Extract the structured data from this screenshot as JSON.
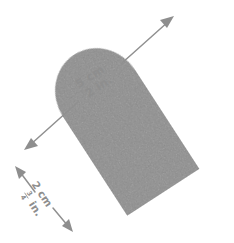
{
  "figure": {
    "background_color": "#ffffff",
    "object": {
      "name": "rounded-capsule-block",
      "fill_color": "#8c8c8c",
      "texture": "grainy-scan",
      "rotation_degrees": -33,
      "shape_description": "rectangle with one rounded (domed) end and one flat end"
    },
    "annotations": {
      "length": {
        "name": "length-dimension",
        "arrow_style": "double-headed",
        "label_metric": "5 cm",
        "label_imperial": "2 in.",
        "text_rotation_degrees": -33,
        "arrow_color": "#8e8e8e"
      },
      "width": {
        "name": "width-dimension",
        "arrow_style": "double-headed-split",
        "label_metric": "2 cm",
        "label_imperial_whole": "",
        "label_imperial_numerator": "3",
        "label_imperial_denominator": "4",
        "label_imperial_unit": "in.",
        "label_imperial_full": "3/4 in.",
        "text_rotation_degrees": 57,
        "arrow_color": "#8e8e8e"
      }
    }
  }
}
